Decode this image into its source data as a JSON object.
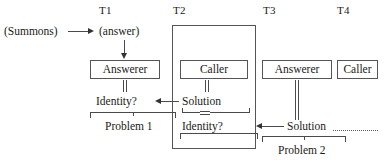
{
  "figure": {
    "type": "sequence-interaction-diagram",
    "time_labels": [
      "T1",
      "T2",
      "T3",
      "T4"
    ],
    "entities": {
      "t1_answerer": "Answerer",
      "t2_caller": "Caller",
      "t3_answerer": "Answerer",
      "t4_caller": "Caller"
    },
    "messages": {
      "summons": "(Summons)",
      "answer": "(answer)",
      "identity_t1": "Identity?",
      "solution_t2": "Solution",
      "identity_t2": "Identity?",
      "solution_t3": "Solution"
    },
    "brackets": {
      "problem_1": "Problem 1",
      "problem_2": "Problem 2"
    },
    "continuation": "…………",
    "colors": {
      "stroke": "#555555",
      "text": "#1a1a1a",
      "background": "#ffffff"
    }
  }
}
